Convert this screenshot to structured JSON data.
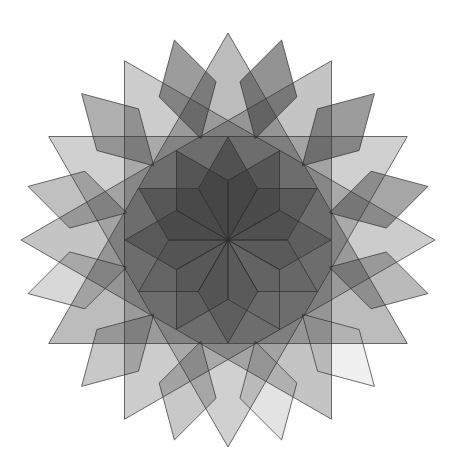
{
  "figure": {
    "width": 457,
    "height": 475,
    "background": "#ffffff",
    "center": [
      228,
      240
    ],
    "fill_color": "#3a3a3a",
    "stroke_color": "#2a2a2a",
    "stroke_width": 0.9,
    "stroke_opacity": 0.75
  },
  "layers": {
    "triangles": {
      "label": "large equilateral triangles",
      "circumradius": 207,
      "items": [
        {
          "angle": 0,
          "opacity": 0.34
        },
        {
          "angle": 30,
          "opacity": 0.3
        },
        {
          "angle": 60,
          "opacity": 0.24
        },
        {
          "angle": 90,
          "opacity": 0.26
        }
      ]
    },
    "outer_rhombi": {
      "label": "outer ring of 60-degree rhombi",
      "inner_radius": 105,
      "outer_radius": 207,
      "items": [
        {
          "angle": 15,
          "opacity": 0.55
        },
        {
          "angle": 45,
          "opacity": 0.5
        },
        {
          "angle": 75,
          "opacity": 0.45
        },
        {
          "angle": 105,
          "opacity": 0.35
        },
        {
          "angle": 135,
          "opacity": 0.08
        },
        {
          "angle": 165,
          "opacity": 0.14
        },
        {
          "angle": 195,
          "opacity": 0.28
        },
        {
          "angle": 225,
          "opacity": 0.28
        },
        {
          "angle": 255,
          "opacity": 0.2
        },
        {
          "angle": 285,
          "opacity": 0.32
        },
        {
          "angle": 315,
          "opacity": 0.4
        },
        {
          "angle": 345,
          "opacity": 0.5
        }
      ]
    },
    "inner_rhombi": {
      "label": "inner star of 60-degree rhombi",
      "outer_radius": 103,
      "items": [
        {
          "angle": 0,
          "opacity": 0.55
        },
        {
          "angle": 30,
          "opacity": 0.45
        },
        {
          "angle": 60,
          "opacity": 0.38
        },
        {
          "angle": 90,
          "opacity": 0.3
        },
        {
          "angle": 120,
          "opacity": 0.1
        },
        {
          "angle": 150,
          "opacity": 0.08
        },
        {
          "angle": 180,
          "opacity": 0.32
        },
        {
          "angle": 210,
          "opacity": 0.26
        },
        {
          "angle": 240,
          "opacity": 0.16
        },
        {
          "angle": 270,
          "opacity": 0.38
        },
        {
          "angle": 300,
          "opacity": 0.42
        },
        {
          "angle": 330,
          "opacity": 0.48
        }
      ]
    }
  }
}
